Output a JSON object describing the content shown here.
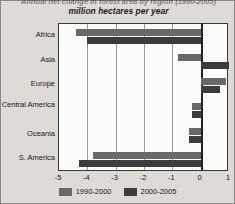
{
  "chart_data": {
    "type": "bar",
    "orientation": "horizontal",
    "title": "Annual net change in forest area by region (1990-2005)",
    "title_line1": "Annual net change in forest area by region (1990-2005)",
    "title_line2": "million hectares per year",
    "xlabel": "",
    "ylabel": "",
    "xlim": [
      -5,
      1
    ],
    "xticks": [
      -5,
      -4,
      -3,
      -2,
      -1,
      0,
      1
    ],
    "xticklabels": [
      "-5",
      "-4",
      "-3",
      "-2",
      "-1",
      "0",
      "1"
    ],
    "grid": true,
    "legend_position": "bottom",
    "categories": [
      "Africa",
      "Asia",
      "Europe",
      "N. & Central America",
      "Oceania",
      "S. America"
    ],
    "series": [
      {
        "name": "1990-2000",
        "color": "#686868",
        "values": [
          -4.4,
          -0.8,
          0.9,
          -0.3,
          -0.4,
          -3.8
        ]
      },
      {
        "name": "2000-2005",
        "color": "#3c3c3c",
        "values": [
          -4.0,
          1.0,
          0.7,
          -0.3,
          -0.4,
          -4.3
        ]
      }
    ]
  },
  "legend": {
    "items": [
      {
        "label": "1990-2000",
        "color": "#686868"
      },
      {
        "label": "2000-2005",
        "color": "#3c3c3c"
      }
    ]
  },
  "colors": {
    "series_1990_2000": "#686868",
    "series_2000_2005": "#3c3c3c",
    "plot_background": "#fbfbf9",
    "page_background": "#dedbd6",
    "axis": "#232323",
    "gridline": "#9a9a94"
  }
}
